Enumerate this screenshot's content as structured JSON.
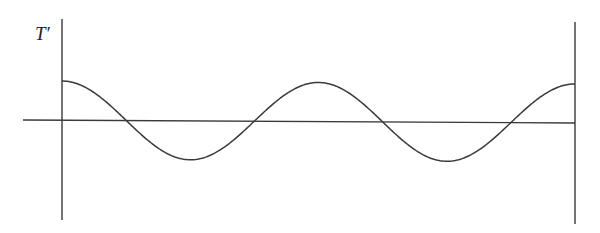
{
  "figure": {
    "y_axis_label": "T′",
    "colors": {
      "stroke": "#3a3a3a",
      "background": "#ffffff"
    }
  },
  "chart_data": {
    "type": "line",
    "title": "",
    "xlabel": "",
    "ylabel": "T′",
    "x": [
      0,
      0.125,
      0.25,
      0.375,
      0.5,
      0.625,
      0.75,
      0.875,
      1.0
    ],
    "series": [
      {
        "name": "T′",
        "values": [
          1,
          0,
          -1,
          0,
          1,
          0,
          -1,
          0,
          1
        ]
      }
    ],
    "periods": 2,
    "grid": false,
    "legend": null
  }
}
